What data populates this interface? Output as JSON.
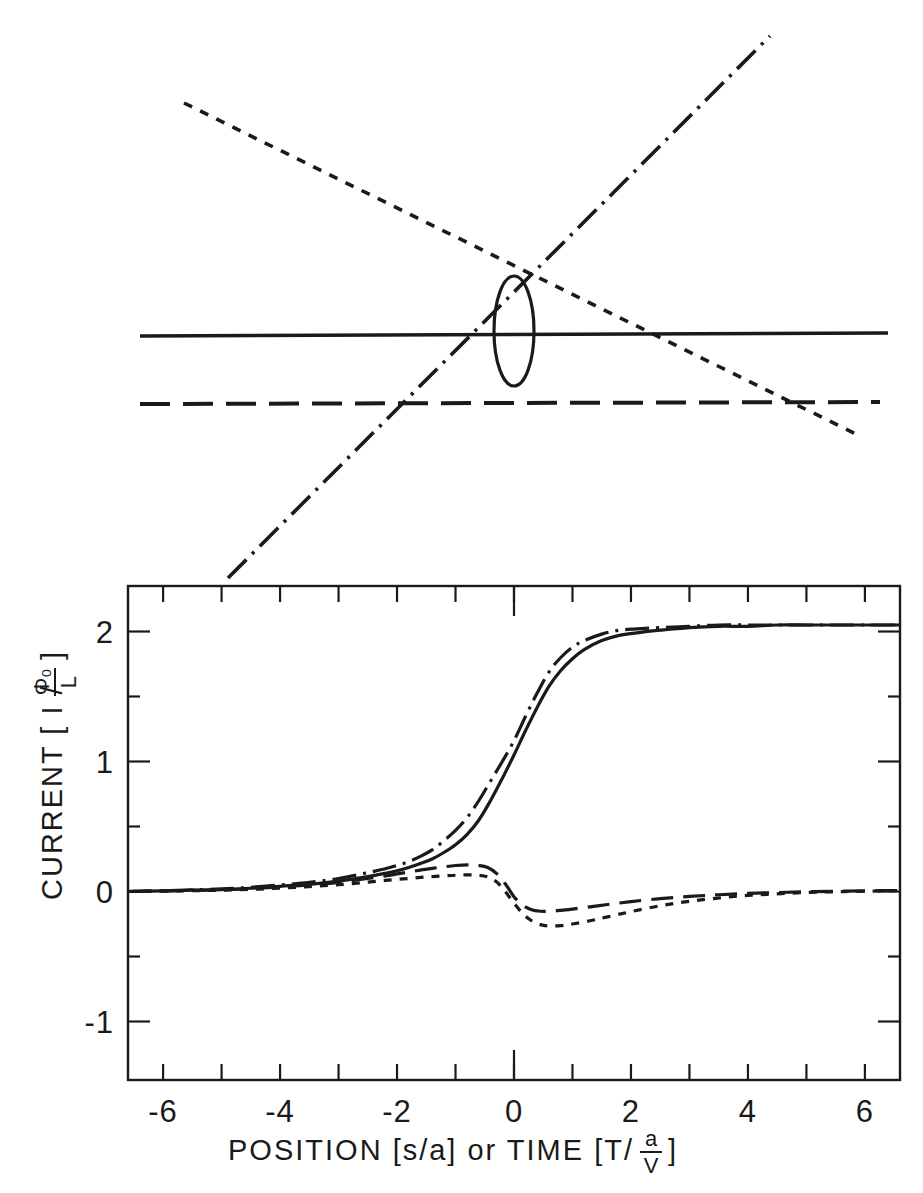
{
  "figure": {
    "title": "",
    "background_color": "#ffffff",
    "ink_color": "#1a1a1a",
    "width": 923,
    "height": 1193
  },
  "upper_diagram": {
    "name": "schematic-line-diagram",
    "description": "Four straight lines of differing dash styles crossing, with a narrow vertical ellipse near the crossing region",
    "elements": [
      {
        "id": "solid-horizontal",
        "style": "solid",
        "label": "solid horizontal line"
      },
      {
        "id": "long-dash-horizontal",
        "style": "long-dash",
        "label": "long dashed horizontal line"
      },
      {
        "id": "short-dash-descending",
        "style": "short-dash",
        "label": "short dashed descending line"
      },
      {
        "id": "dash-dot-ascending",
        "style": "dash-dot",
        "label": "dash-dot ascending line"
      },
      {
        "id": "vertical-ellipse",
        "style": "solid",
        "label": "narrow vertical ellipse"
      }
    ]
  },
  "chart_data": {
    "type": "line",
    "title": "",
    "xlabel": "POSITION [s/a] or TIME [T/ a/V ]",
    "xlabel_parts": {
      "prefix": "POSITION [s/a]  or  TIME [T/",
      "numerator": "a",
      "denominator": "V",
      "suffix": "]"
    },
    "ylabel": "CURRENT [ I / Φ₀/L ]",
    "ylabel_parts": {
      "prefix": "CURRENT  [ I /",
      "numerator": "Φ₀",
      "denominator": "L",
      "suffix": "]"
    },
    "xlim": [
      -6.6,
      6.6
    ],
    "ylim": [
      -1.45,
      2.35
    ],
    "xticks": [
      -6,
      -5,
      -4,
      -3,
      -2,
      -1,
      0,
      1,
      2,
      3,
      4,
      5,
      6
    ],
    "xtick_labels": [
      "-6",
      "",
      "-4",
      "",
      "-2",
      "",
      "0",
      "",
      "2",
      "",
      "4",
      "",
      "6"
    ],
    "yticks": [
      -1,
      0,
      1,
      2
    ],
    "ytick_labels": [
      "-1",
      "0",
      "1",
      "2"
    ],
    "grid": false,
    "legend_position": "none",
    "frame": true,
    "series": [
      {
        "name": "solid-current",
        "style": "solid",
        "x": [
          -6.6,
          -6.0,
          -5.5,
          -5.0,
          -4.5,
          -4.0,
          -3.5,
          -3.0,
          -2.5,
          -2.2,
          -2.0,
          -1.8,
          -1.6,
          -1.4,
          -1.2,
          -1.0,
          -0.8,
          -0.6,
          -0.4,
          -0.2,
          0.0,
          0.2,
          0.4,
          0.6,
          0.8,
          1.0,
          1.2,
          1.5,
          1.8,
          2.1,
          2.5,
          3.0,
          3.5,
          4.0,
          4.5,
          5.0,
          5.5,
          6.0,
          6.6
        ],
        "y": [
          0.0,
          0.005,
          0.01,
          0.015,
          0.025,
          0.04,
          0.055,
          0.08,
          0.115,
          0.14,
          0.16,
          0.185,
          0.215,
          0.25,
          0.3,
          0.36,
          0.44,
          0.55,
          0.7,
          0.87,
          1.05,
          1.24,
          1.42,
          1.58,
          1.7,
          1.79,
          1.86,
          1.93,
          1.97,
          1.99,
          2.01,
          2.03,
          2.04,
          2.04,
          2.05,
          2.05,
          2.05,
          2.05,
          2.05
        ]
      },
      {
        "name": "dash-dot-current",
        "style": "dash-dot",
        "x": [
          -6.6,
          -6.0,
          -5.5,
          -5.0,
          -4.5,
          -4.0,
          -3.5,
          -3.0,
          -2.5,
          -2.2,
          -2.0,
          -1.8,
          -1.6,
          -1.4,
          -1.2,
          -1.0,
          -0.8,
          -0.6,
          -0.4,
          -0.2,
          0.0,
          0.2,
          0.4,
          0.6,
          0.8,
          1.0,
          1.2,
          1.5,
          1.8,
          2.1,
          2.5,
          3.0,
          3.5,
          4.0,
          4.5,
          5.0,
          5.5,
          6.0,
          6.6
        ],
        "y": [
          0.0,
          0.005,
          0.012,
          0.02,
          0.032,
          0.05,
          0.07,
          0.1,
          0.145,
          0.175,
          0.2,
          0.23,
          0.27,
          0.32,
          0.39,
          0.47,
          0.57,
          0.7,
          0.85,
          1.0,
          1.16,
          1.35,
          1.53,
          1.69,
          1.8,
          1.88,
          1.93,
          1.98,
          2.01,
          2.02,
          2.03,
          2.04,
          2.05,
          2.05,
          2.05,
          2.05,
          2.05,
          2.05,
          2.05
        ]
      },
      {
        "name": "long-dash-current",
        "style": "long-dash",
        "x": [
          -6.6,
          -6.0,
          -5.5,
          -5.0,
          -4.5,
          -4.0,
          -3.5,
          -3.0,
          -2.5,
          -2.2,
          -2.0,
          -1.8,
          -1.6,
          -1.4,
          -1.2,
          -1.0,
          -0.8,
          -0.6,
          -0.45,
          -0.3,
          -0.15,
          0.0,
          0.15,
          0.3,
          0.45,
          0.6,
          0.8,
          1.0,
          1.3,
          1.6,
          2.0,
          2.5,
          3.0,
          3.5,
          4.0,
          4.5,
          5.0,
          5.5,
          6.0,
          6.6
        ],
        "y": [
          0.0,
          0.004,
          0.008,
          0.013,
          0.022,
          0.035,
          0.05,
          0.07,
          0.1,
          0.12,
          0.135,
          0.15,
          0.165,
          0.178,
          0.19,
          0.2,
          0.205,
          0.2,
          0.185,
          0.14,
          0.06,
          -0.04,
          -0.105,
          -0.14,
          -0.152,
          -0.152,
          -0.145,
          -0.135,
          -0.118,
          -0.1,
          -0.078,
          -0.055,
          -0.038,
          -0.025,
          -0.015,
          -0.008,
          -0.002,
          0.002,
          0.005,
          0.008
        ]
      },
      {
        "name": "short-dash-current",
        "style": "short-dash",
        "x": [
          -6.6,
          -6.0,
          -5.5,
          -5.0,
          -4.5,
          -4.0,
          -3.5,
          -3.0,
          -2.5,
          -2.2,
          -2.0,
          -1.8,
          -1.6,
          -1.4,
          -1.2,
          -1.0,
          -0.8,
          -0.6,
          -0.45,
          -0.3,
          -0.15,
          0.0,
          0.15,
          0.3,
          0.45,
          0.6,
          0.8,
          1.0,
          1.3,
          1.6,
          2.0,
          2.5,
          3.0,
          3.5,
          4.0,
          4.5,
          5.0,
          5.5,
          6.0,
          6.6
        ],
        "y": [
          0.0,
          0.003,
          0.006,
          0.01,
          0.016,
          0.026,
          0.038,
          0.052,
          0.072,
          0.085,
          0.093,
          0.1,
          0.108,
          0.115,
          0.12,
          0.125,
          0.128,
          0.125,
          0.112,
          0.075,
          0.0,
          -0.09,
          -0.17,
          -0.225,
          -0.255,
          -0.265,
          -0.262,
          -0.25,
          -0.225,
          -0.195,
          -0.155,
          -0.11,
          -0.075,
          -0.05,
          -0.03,
          -0.018,
          -0.008,
          -0.002,
          0.002,
          0.006
        ]
      }
    ]
  }
}
